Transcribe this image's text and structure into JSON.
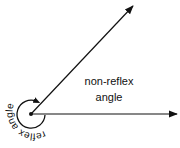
{
  "diagram": {
    "labels": {
      "non_reflex_line1": "non-reflex",
      "non_reflex_line2": "angle",
      "reflex": "reflex angle"
    },
    "vertex": {
      "x": 31,
      "y": 114
    },
    "rays": [
      {
        "name": "upper-ray",
        "x2": 135,
        "y2": 4
      },
      {
        "name": "horizontal-ray",
        "x2": 179,
        "y2": 114
      }
    ],
    "colors": {
      "stroke": "#111111",
      "background": "#ffffff"
    }
  }
}
